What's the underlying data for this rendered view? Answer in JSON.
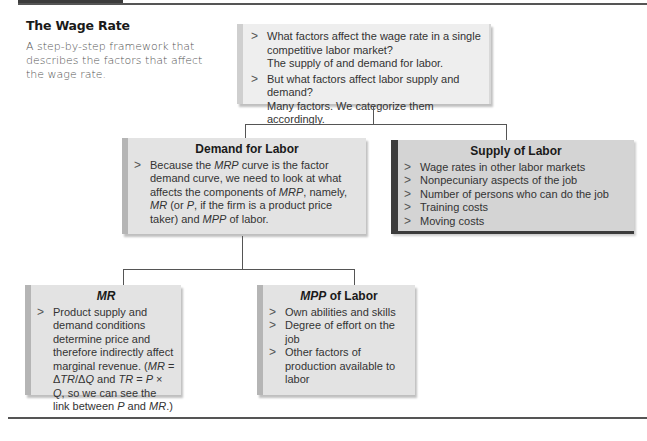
{
  "header": {
    "title": "The Wage Rate",
    "description": "A step-by-step framework that describes the factors that affect the wage rate."
  },
  "top_box": {
    "items": [
      {
        "text": "What factors affect the wage rate in a single competitive labor market?",
        "answer": "The supply of and demand for labor."
      },
      {
        "text": "But what factors affect labor supply and demand?",
        "answer": "Many factors. We categorize them accordingly."
      }
    ]
  },
  "demand_box": {
    "title": "Demand for Labor",
    "items": [
      {
        "parts": [
          "Because the ",
          "MRP",
          " curve is the factor demand curve, we need to look at what affects the components of ",
          "MRP",
          ", namely, ",
          "MR",
          " (or ",
          "P",
          ", if the firm is a product price taker) and ",
          "MPP",
          " of labor."
        ]
      }
    ]
  },
  "supply_box": {
    "title": "Supply of Labor",
    "items": [
      "Wage rates in other labor markets",
      "Nonpecuniary aspects of the job",
      "Number of persons who can do the job",
      "Training costs",
      "Moving costs"
    ]
  },
  "mr_box": {
    "title": "MR",
    "items": [
      {
        "parts": [
          "Product supply and demand conditions determine price and therefore indirectly affect marginal revenue. (",
          "MR",
          " = Δ",
          "TR",
          "/Δ",
          "Q",
          " and ",
          "TR",
          " = ",
          "P",
          " × ",
          "Q",
          ", so we can see the link between ",
          "P",
          " and ",
          "MR",
          ".)"
        ]
      }
    ]
  },
  "mpp_box": {
    "title_italic": "MPP",
    "title_rest": " of Labor",
    "items": [
      "Own abilities and skills",
      "Degree of effort on the job",
      "Other factors of production available to labor"
    ]
  },
  "bullet_glyph": ">",
  "colors": {
    "background": "#ffffff",
    "box_light": "#eeeeee",
    "box_mid": "#e3e3e3",
    "box_dark": "#d4d4d4",
    "accent_dark": "#3c3c3c",
    "text": "#333333"
  }
}
